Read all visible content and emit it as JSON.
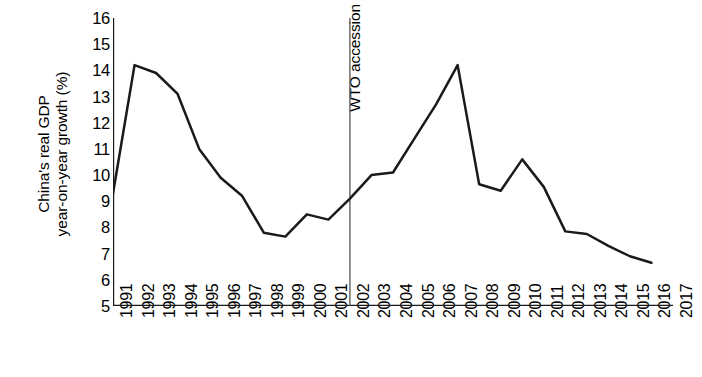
{
  "chart_data": {
    "type": "line",
    "title": "",
    "xlabel": "",
    "ylabel_line1": "China's real GDP",
    "ylabel_line2": "year-on-year growth (%)",
    "ylim": [
      5,
      16
    ],
    "xlim": [
      1991,
      2017
    ],
    "grid": false,
    "legend": "none",
    "y_ticks": [
      16,
      15,
      14,
      13,
      12,
      11,
      10,
      9,
      8,
      7,
      6,
      5
    ],
    "x_ticks": [
      1991,
      1992,
      1993,
      1994,
      1995,
      1996,
      1997,
      1998,
      1999,
      2000,
      2001,
      2002,
      2003,
      2004,
      2005,
      2006,
      2007,
      2008,
      2009,
      2010,
      2011,
      2012,
      2013,
      2014,
      2015,
      2016,
      2017
    ],
    "x": [
      1991,
      1992,
      1993,
      1994,
      1995,
      1996,
      1997,
      1998,
      1999,
      2000,
      2001,
      2002,
      2003,
      2004,
      2005,
      2006,
      2007,
      2008,
      2009,
      2010,
      2011,
      2012,
      2013,
      2014,
      2015,
      2016
    ],
    "values": [
      9.3,
      14.2,
      13.9,
      13.1,
      11.0,
      9.9,
      9.2,
      7.8,
      7.65,
      8.5,
      8.3,
      9.1,
      10.0,
      10.1,
      11.4,
      12.7,
      14.2,
      9.65,
      9.4,
      10.6,
      9.55,
      7.85,
      7.75,
      7.3,
      6.9,
      6.65
    ],
    "series": [
      {
        "name": "China's real GDP year-on-year growth (%)",
        "color": "#1a1a1a",
        "values": [
          9.3,
          14.2,
          13.9,
          13.1,
          11.0,
          9.9,
          9.2,
          7.8,
          7.65,
          8.5,
          8.3,
          9.1,
          10.0,
          10.1,
          11.4,
          12.7,
          14.2,
          9.65,
          9.4,
          10.6,
          9.55,
          7.85,
          7.75,
          7.3,
          6.9,
          6.65
        ]
      }
    ],
    "annotations": [
      {
        "label": "WTO accession",
        "x": 2002,
        "orientation": "vertical-line-with-rotated-text",
        "color": "#555555"
      }
    ]
  },
  "axis": {
    "y_title_line1": "China's real GDP",
    "y_title_line2": "year-on-year growth (%)"
  },
  "annotation": {
    "wto_label": "WTO accession"
  },
  "ytick_labels": [
    "16",
    "15",
    "14",
    "13",
    "12",
    "11",
    "10",
    "9",
    "8",
    "7",
    "6",
    "5"
  ],
  "xtick_labels": [
    "1991",
    "1992",
    "1993",
    "1994",
    "1995",
    "1996",
    "1997",
    "1998",
    "1999",
    "2000",
    "2001",
    "2002",
    "2003",
    "2004",
    "2005",
    "2006",
    "2007",
    "2008",
    "2009",
    "2010",
    "2011",
    "2012",
    "2013",
    "2014",
    "2015",
    "2016",
    "2017"
  ],
  "colors": {
    "line": "#1a1a1a",
    "axis": "#1a1a1a",
    "annotation_rule": "#555555",
    "background": "#ffffff"
  }
}
